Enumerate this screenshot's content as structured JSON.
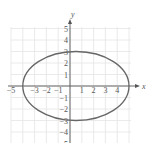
{
  "chart_data": {
    "type": "line",
    "title": "",
    "xlabel": "x",
    "ylabel": "y",
    "xlim": [
      -5,
      5
    ],
    "ylim": [
      -5,
      5
    ],
    "grid": true,
    "x_ticks": [
      -5,
      -4,
      -3,
      -2,
      -1,
      1,
      2,
      3,
      4,
      5
    ],
    "y_ticks": [
      -5,
      -4,
      -3,
      -2,
      -1,
      1,
      2,
      3,
      4,
      5
    ],
    "x_tick_labels_visible": [
      "-5",
      "-3",
      "-2",
      "-1",
      "1",
      "2",
      "3",
      "4"
    ],
    "y_tick_labels_visible": [
      "5",
      "4",
      "3",
      "2",
      "1",
      "-1",
      "-2",
      "-3",
      "-4",
      "-5"
    ],
    "series": [
      {
        "name": "ellipse",
        "shape": "ellipse",
        "center": [
          0.5,
          0
        ],
        "semi_axis_x": 4.5,
        "semi_axis_y": 3,
        "equation": "(x-0.5)^2/20.25 + y^2/9 = 1",
        "key_points": [
          [
            -4,
            0
          ],
          [
            5,
            0
          ],
          [
            0.5,
            3
          ],
          [
            0.5,
            -3
          ]
        ],
        "color": "#666666"
      }
    ]
  },
  "colors": {
    "grid": "#e4e4e4",
    "axis": "#555555",
    "curve": "#666666"
  }
}
